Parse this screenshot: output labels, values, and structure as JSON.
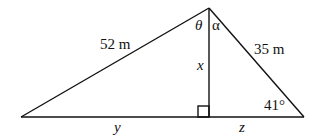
{
  "diagram": {
    "type": "triangle-with-altitude",
    "labels": {
      "left_side": "52 m",
      "right_side": "35 m",
      "altitude": "x",
      "left_base_segment": "y",
      "right_base_segment": "z",
      "apex_left_angle": "θ",
      "apex_right_angle": "α",
      "base_right_angle": "41°"
    },
    "colors": {
      "stroke": "#111111",
      "background": "#ffffff"
    }
  }
}
